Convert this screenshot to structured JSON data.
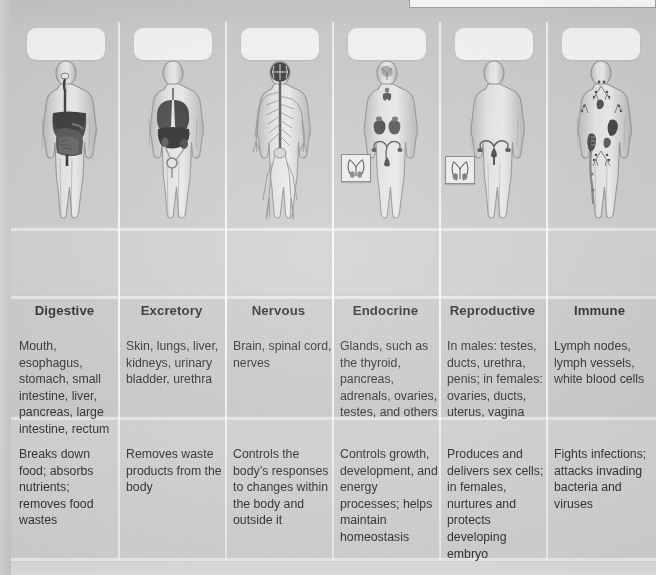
{
  "page": {
    "kind": "textbook-comparison-table",
    "background_color": "#c9c9c9",
    "text_color": "#232323"
  },
  "top_panel": {
    "label": "",
    "background_color": "#fdfdfd",
    "border_color": "#9d9d9d"
  },
  "columns": [
    {
      "id": "digestive",
      "name": "Digestive",
      "plate_label": "",
      "figure_name": "digestive-system-body-diagram",
      "organs": "Mouth, esophagus, stomach, small intestine, liver, pancreas, large intestine, rectum",
      "functions": "Breaks down food; absorbs nutrients; removes food wastes",
      "has_inset": false
    },
    {
      "id": "excretory",
      "name": "Excretory",
      "plate_label": "",
      "figure_name": "excretory-system-body-diagram",
      "organs": "Skin, lungs, liver, kidneys, urinary bladder, urethra",
      "functions": "Removes waste products from the body",
      "has_inset": false
    },
    {
      "id": "nervous",
      "name": "Nervous",
      "plate_label": "",
      "figure_name": "nervous-system-body-diagram",
      "organs": "Brain, spinal cord, nerves",
      "functions": "Controls the body’s responses to changes within the body and outside it",
      "has_inset": false
    },
    {
      "id": "endocrine",
      "name": "Endocrine",
      "plate_label": "",
      "figure_name": "endocrine-system-body-diagram",
      "organs": "Glands, such as the thyroid, pancreas, adrenals, ovaries, testes, and others",
      "functions": "Controls growth, development, and energy processes; helps maintain homeostasis",
      "has_inset": true
    },
    {
      "id": "reproductive",
      "name": "Reproductive",
      "plate_label": "",
      "figure_name": "reproductive-system-body-diagram",
      "organs": "In males: testes, ducts, urethra, penis; in females: ovaries, ducts, uterus, vagina",
      "functions": "Produces and delivers sex cells; in females, nurtures and protects developing embryo",
      "has_inset": true
    },
    {
      "id": "immune",
      "name": "Immune",
      "plate_label": "",
      "figure_name": "immune-system-body-diagram",
      "organs": "Lymph nodes, lymph vessels, white blood cells",
      "functions": "Fights infections; attacks invading bacteria and viruses",
      "has_inset": false
    }
  ]
}
